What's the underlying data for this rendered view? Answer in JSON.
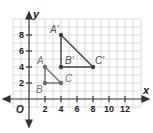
{
  "diagram": {
    "type": "coordinate-plane",
    "axes": {
      "x_label": "x",
      "y_label": "y",
      "origin_label": "O",
      "x_ticks": [
        "2",
        "4",
        "6",
        "8",
        "10",
        "12"
      ],
      "y_ticks": [
        "2",
        "4",
        "6",
        "8"
      ]
    },
    "colors": {
      "grid": "#dcdcdc",
      "axis": "#333333",
      "original_triangle": "#7a7a7a",
      "image_triangle": "#4a4a4a",
      "tick_text": "#222222"
    },
    "original_triangle": {
      "name": "ABC",
      "points": [
        {
          "label": "A",
          "x": 2,
          "y": 4
        },
        {
          "label": "B",
          "x": 2,
          "y": 2
        },
        {
          "label": "C",
          "x": 4,
          "y": 2
        }
      ]
    },
    "image_triangle": {
      "name": "A'B'C'",
      "points": [
        {
          "label": "A′",
          "x": 4,
          "y": 8
        },
        {
          "label": "B′",
          "x": 4,
          "y": 4
        },
        {
          "label": "C′",
          "x": 8,
          "y": 4
        }
      ]
    }
  }
}
